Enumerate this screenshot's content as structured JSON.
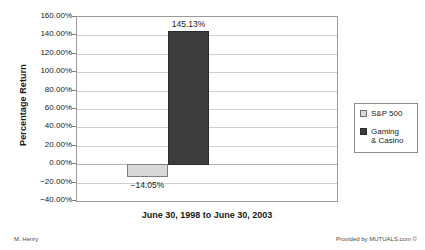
{
  "chart_data": {
    "type": "bar",
    "title": "",
    "xlabel": "June 30, 1998 to June 30, 2003",
    "ylabel": "Percentage Return",
    "categories": [
      "June 30, 1998 to June 30, 2003"
    ],
    "series": [
      {
        "name": "S&P 500",
        "values": [
          -14.05
        ],
        "value_labels": [
          "−14.05%"
        ],
        "color": "#d9d9d9"
      },
      {
        "name": "Gaming & Casino",
        "values": [
          145.13
        ],
        "value_labels": [
          "145.13%"
        ],
        "color": "#3c3c3c"
      }
    ],
    "ylim": [
      -40,
      160
    ],
    "ytick_step": 20,
    "ytick_labels": [
      "160.00%",
      "140.00%",
      "120.00%",
      "100.00%",
      "80.00%",
      "60.00%",
      "40.00%",
      "20.00%",
      "0.00%",
      "−20.00%",
      "−40.00%"
    ],
    "ytick_values": [
      160,
      140,
      120,
      100,
      80,
      60,
      40,
      20,
      0,
      -20,
      -40
    ],
    "grid": true,
    "legend_position": "right",
    "legend_entries": [
      "S&P 500",
      "Gaming\n& Casino"
    ]
  },
  "footer": {
    "left": "M. Henry",
    "right": "Provided by MUTUALS.com ©"
  }
}
